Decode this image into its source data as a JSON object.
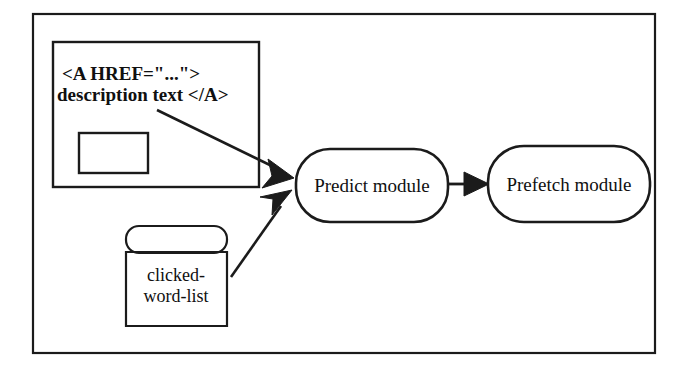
{
  "diagram": {
    "background_color": "#ffffff",
    "stroke_color": "#1b1b1b",
    "outer_frame": {
      "name": "outer-frame"
    },
    "html_source_box": {
      "label": "HTML anchor source box",
      "line1": "<A HREF=\"...\">",
      "line2": "description text </A>",
      "inner_rect_label": ""
    },
    "datastore": {
      "line1": "clicked-",
      "line2": "word-list"
    },
    "nodes": [
      {
        "id": "predict",
        "label": "Predict module",
        "shape": "stadium"
      },
      {
        "id": "prefetch",
        "label": "Prefetch module",
        "shape": "stadium"
      }
    ],
    "edges": [
      {
        "id": "anchor-to-predict",
        "from": "html_source_box",
        "to": "predict",
        "label": ""
      },
      {
        "id": "wordlist-to-predict",
        "from": "datastore",
        "to": "predict",
        "label": ""
      },
      {
        "id": "predict-to-prefetch",
        "from": "predict",
        "to": "prefetch",
        "label": ""
      }
    ]
  }
}
